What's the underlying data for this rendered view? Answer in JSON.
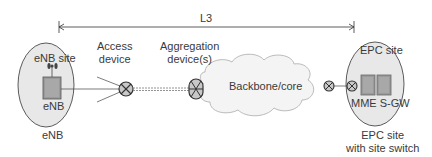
{
  "diagram": {
    "span_label": "L3",
    "enb_site": {
      "title": "eNB site",
      "node_label": "eNB",
      "caption": "eNB"
    },
    "access_device": {
      "line1": "Access",
      "line2": "device"
    },
    "aggregation": {
      "line1": "Aggregation",
      "line2": "device(s)"
    },
    "backbone": {
      "label": "Backbone/core"
    },
    "epc_site": {
      "title": "EPC site",
      "node_labels": "MME S-GW",
      "caption_line1": "EPC site",
      "caption_line2": "with site switch"
    },
    "colors": {
      "ellipse_fill": "#e8e8e8",
      "cloud_fill": "#f4f4f4",
      "box_fill": "#9a9a9a",
      "router_fill": "#c8c8c8",
      "stroke": "#333333"
    }
  }
}
